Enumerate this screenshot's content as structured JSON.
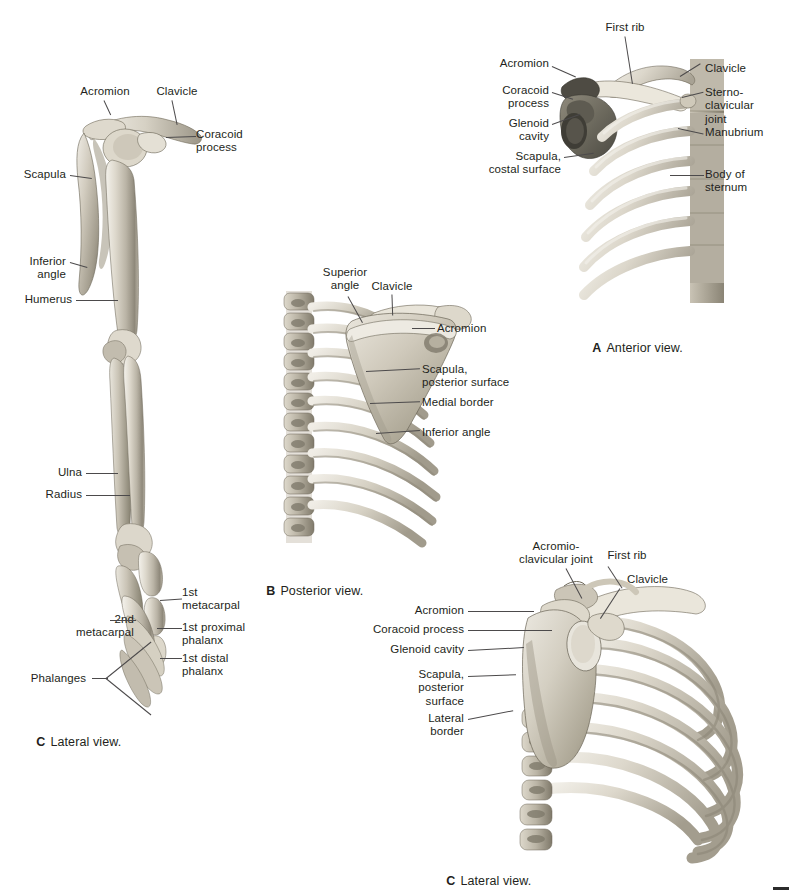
{
  "plate": {
    "title": "Shoulder girdle and upper limb skeleton",
    "background_color": "#ffffff",
    "label_color": "#231f20",
    "leader_color": "#4c4a4b"
  },
  "panels": [
    {
      "id": "A",
      "letter": "A",
      "caption": "Anterior view.",
      "caption_full": "A  Anterior view.",
      "labels": [
        {
          "text": "First rib",
          "align": "center"
        },
        {
          "text": "Acromion",
          "align": "right"
        },
        {
          "text": "Coracoid\nprocess",
          "align": "right"
        },
        {
          "text": "Glenoid\ncavity",
          "align": "right"
        },
        {
          "text": "Scapula,\ncostal surface",
          "align": "right"
        },
        {
          "text": "Clavicle",
          "align": "left"
        },
        {
          "text": "Sterno-\nclavicular\njoint",
          "align": "left"
        },
        {
          "text": "Manubrium",
          "align": "left"
        },
        {
          "text": "Body of\nsternum",
          "align": "left"
        }
      ]
    },
    {
      "id": "B",
      "letter": "B",
      "caption": "Posterior view.",
      "caption_full": "B  Posterior view.",
      "labels": [
        {
          "text": "Superior\nangle",
          "align": "center"
        },
        {
          "text": "Clavicle",
          "align": "center"
        },
        {
          "text": "Acromion",
          "align": "left"
        },
        {
          "text": "Scapula,\nposterior surface",
          "align": "left"
        },
        {
          "text": "Medial border",
          "align": "left"
        },
        {
          "text": "Inferior angle",
          "align": "left"
        }
      ]
    },
    {
      "id": "C-left",
      "letter": "C",
      "caption": "Lateral view.",
      "caption_full": "C  Lateral view.",
      "labels": [
        {
          "text": "Acromion",
          "align": "center"
        },
        {
          "text": "Clavicle",
          "align": "center"
        },
        {
          "text": "Coracoid\nprocess",
          "align": "left"
        },
        {
          "text": "Scapula",
          "align": "right"
        },
        {
          "text": "Inferior\nangle",
          "align": "right"
        },
        {
          "text": "Humerus",
          "align": "right"
        },
        {
          "text": "Ulna",
          "align": "right"
        },
        {
          "text": "Radius",
          "align": "right"
        },
        {
          "text": "1st\nmetacarpal",
          "align": "left"
        },
        {
          "text": "1st proximal\nphalanx",
          "align": "left"
        },
        {
          "text": "1st distal\nphalanx",
          "align": "left"
        },
        {
          "text": "2nd\nmetacarpal",
          "align": "right"
        },
        {
          "text": "Phalanges",
          "align": "right"
        }
      ]
    },
    {
      "id": "C-right",
      "letter": "C",
      "caption": "Lateral view.",
      "caption_full": "C  Lateral view.",
      "labels": [
        {
          "text": "Acromio-\nclavicular joint",
          "align": "center"
        },
        {
          "text": "First rib",
          "align": "center"
        },
        {
          "text": "Clavicle",
          "align": "left"
        },
        {
          "text": "Acromion",
          "align": "right"
        },
        {
          "text": "Coracoid process",
          "align": "right"
        },
        {
          "text": "Glenoid cavity",
          "align": "right"
        },
        {
          "text": "Scapula,\nposterior\nsurface",
          "align": "right"
        },
        {
          "text": "Lateral\nborder",
          "align": "right"
        }
      ]
    }
  ],
  "labels_flat": {
    "a_first_rib": "First rib",
    "a_acromion": "Acromion",
    "a_coracoid": "Coracoid\nprocess",
    "a_glenoid": "Glenoid\ncavity",
    "a_scapula_costal": "Scapula,\ncostal surface",
    "a_clavicle": "Clavicle",
    "a_sc_joint": "Sterno-\nclavicular\njoint",
    "a_manubrium": "Manubrium",
    "a_body_sternum": "Body of\nsternum",
    "a_caption_letter": "A",
    "a_caption_text": "Anterior view.",
    "b_superior_angle": "Superior\nangle",
    "b_clavicle": "Clavicle",
    "b_acromion": "Acromion",
    "b_scapula_post": "Scapula,\nposterior surface",
    "b_medial_border": "Medial border",
    "b_inferior_angle": "Inferior angle",
    "b_caption_letter": "B",
    "b_caption_text": "Posterior view.",
    "cl_acromion": "Acromion",
    "cl_clavicle": "Clavicle",
    "cl_coracoid": "Coracoid\nprocess",
    "cl_scapula": "Scapula",
    "cl_inferior_angle": "Inferior\nangle",
    "cl_humerus": "Humerus",
    "cl_ulna": "Ulna",
    "cl_radius": "Radius",
    "cl_1st_metacarpal": "1st\nmetacarpal",
    "cl_1st_prox_phalanx": "1st proximal\nphalanx",
    "cl_1st_distal_phalanx": "1st distal\nphalanx",
    "cl_2nd_metacarpal": "2nd\nmetacarpal",
    "cl_phalanges": "Phalanges",
    "cl_caption_letter": "C",
    "cl_caption_text": "Lateral view.",
    "cr_ac_joint": "Acromio-\nclavicular joint",
    "cr_first_rib": "First rib",
    "cr_clavicle": "Clavicle",
    "cr_acromion": "Acromion",
    "cr_coracoid": "Coracoid process",
    "cr_glenoid": "Glenoid cavity",
    "cr_scapula_post": "Scapula,\nposterior\nsurface",
    "cr_lateral_border": "Lateral\nborder",
    "cr_caption_letter": "C",
    "cr_caption_text": "Lateral view."
  }
}
